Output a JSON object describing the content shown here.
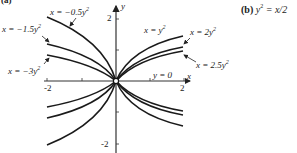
{
  "panel_a": {
    "label": "(a)"
  },
  "panel_b": {
    "label": "(b)",
    "equation_lhs": "y",
    "equation_exp": "2",
    "equation_rhs": " = x/2"
  },
  "axes": {
    "x_label": "x",
    "y_label": "y",
    "x_ticks": [
      "-2",
      "2"
    ],
    "y_ticks": [
      "2",
      "-2"
    ],
    "x_axis_note": "y = 0"
  },
  "curves": [
    {
      "name": "x = -0.5y",
      "label_prefix": "x = −0.5y",
      "exp": "2",
      "coef": -0.5
    },
    {
      "name": "x = -1.5y",
      "label_prefix": "x = −1.5y",
      "exp": "2",
      "coef": -1.5
    },
    {
      "name": "x = -3y",
      "label_prefix": "x = −3y",
      "exp": "2",
      "coef": -3
    },
    {
      "name": "x = y",
      "label_prefix": "x = y",
      "exp": "2",
      "coef": 1
    },
    {
      "name": "x = 2y",
      "label_prefix": "x = 2y",
      "exp": "2",
      "coef": 2
    },
    {
      "name": "x = 2.5y",
      "label_prefix": "x = 2.5y",
      "exp": "2",
      "coef": 2.5
    }
  ]
}
